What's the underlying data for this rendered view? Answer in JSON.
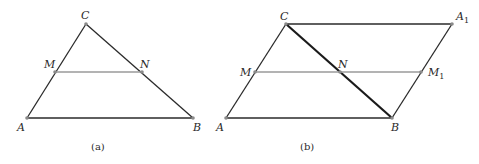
{
  "figures": [
    {
      "caption": "(a)",
      "points": {
        "A": {
          "label": "A",
          "x": 27,
          "y": 118
        },
        "B": {
          "label": "B",
          "x": 193,
          "y": 118
        },
        "C": {
          "label": "C",
          "x": 86,
          "y": 24
        },
        "M": {
          "label": "M",
          "x": 55,
          "y": 72
        },
        "N": {
          "label": "N",
          "x": 142,
          "y": 72
        }
      },
      "segments": [
        [
          "A",
          "B"
        ],
        [
          "A",
          "C"
        ],
        [
          "C",
          "B"
        ],
        [
          "M",
          "N"
        ]
      ],
      "midline": [
        "M",
        "N"
      ]
    },
    {
      "caption": "(b)",
      "points": {
        "A": {
          "label": "A",
          "x": 226,
          "y": 118
        },
        "B": {
          "label": "B",
          "x": 392,
          "y": 118
        },
        "C": {
          "label": "C",
          "x": 286,
          "y": 24
        },
        "A1": {
          "label": "A",
          "sub": "1",
          "x": 452,
          "y": 24
        },
        "M": {
          "label": "M",
          "x": 255,
          "y": 72
        },
        "N": {
          "label": "N",
          "x": 340,
          "y": 72
        },
        "M1": {
          "label": "M",
          "sub": "1",
          "x": 421,
          "y": 72
        }
      },
      "segments": [
        [
          "A",
          "B"
        ],
        [
          "A",
          "C"
        ],
        [
          "C",
          "A1"
        ],
        [
          "A1",
          "B"
        ],
        [
          "C",
          "B"
        ],
        [
          "M",
          "M1"
        ]
      ],
      "midline": [
        "M",
        "M1"
      ],
      "bold": [
        "C",
        "B"
      ]
    }
  ],
  "colors": {
    "line": "#2a2a2a",
    "midline": "#9a9a9a",
    "point": "#8a8a8a"
  }
}
